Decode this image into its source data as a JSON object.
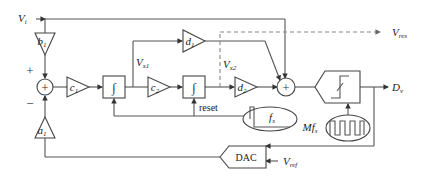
{
  "diagram": {
    "inputs": {
      "vi": {
        "main": "V",
        "sub": "i"
      },
      "vref": {
        "main": "V",
        "sub": "ref"
      }
    },
    "outputs": {
      "vres": {
        "main": "V",
        "sub": "res"
      },
      "dv": {
        "main": "D",
        "sub": "v"
      }
    },
    "nodes": {
      "vx1": {
        "main": "V",
        "sub": "x1"
      },
      "vx2": {
        "main": "V",
        "sub": "x2"
      }
    },
    "gains": {
      "b1": {
        "main": "b",
        "sub": "1"
      },
      "a1": {
        "main": "a",
        "sub": "1"
      },
      "c1": {
        "main": "c",
        "sub": "1"
      },
      "c2": {
        "main": "c",
        "sub": "2"
      },
      "d1": {
        "main": "d",
        "sub": "1"
      },
      "d2": {
        "main": "d",
        "sub": "2"
      }
    },
    "integrator_symbol": "∫",
    "adder_symbol": "+",
    "adder_signs": {
      "plus": "+",
      "minus": "−"
    },
    "reset_label": "reset",
    "clocks": {
      "fs": {
        "main": "f",
        "sub": "s"
      },
      "mfs": {
        "main": "Mf",
        "sub": "s"
      }
    },
    "dac_label": "DAC"
  }
}
